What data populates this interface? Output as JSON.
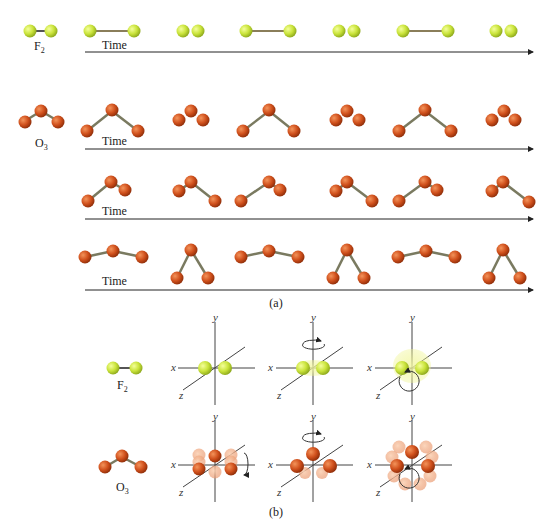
{
  "figure": {
    "part_a_caption": "(a)",
    "part_b_caption": "(b)",
    "time_label": "Time",
    "molecules": {
      "f2": {
        "label": "F",
        "subscript": "2",
        "color": "#c9e33a"
      },
      "o3": {
        "label": "O",
        "subscript": "3",
        "color": "#d0501c"
      }
    },
    "axes": {
      "x": "x",
      "y": "y",
      "z": "z"
    },
    "rows": [
      {
        "name": "F2 stretching vibration",
        "frames": [
          "long",
          "short",
          "long",
          "short",
          "long",
          "short"
        ]
      },
      {
        "name": "O3 symmetric stretch",
        "frames": [
          "wide",
          "compact",
          "wide",
          "compact",
          "wide",
          "compact"
        ]
      },
      {
        "name": "O3 asymmetric stretch",
        "frames": [
          "right-long",
          "left-long",
          "right-long",
          "left-long",
          "right-long",
          "left-long"
        ]
      },
      {
        "name": "O3 bending",
        "frames": [
          "open",
          "closed",
          "open",
          "closed",
          "open",
          "closed"
        ]
      }
    ],
    "rotations": {
      "f2": [
        "no rotation",
        "rotation about y axis",
        "rotation about z axis"
      ],
      "o3": [
        "rotation about x axis",
        "rotation about y axis",
        "rotation about z axis"
      ]
    }
  }
}
